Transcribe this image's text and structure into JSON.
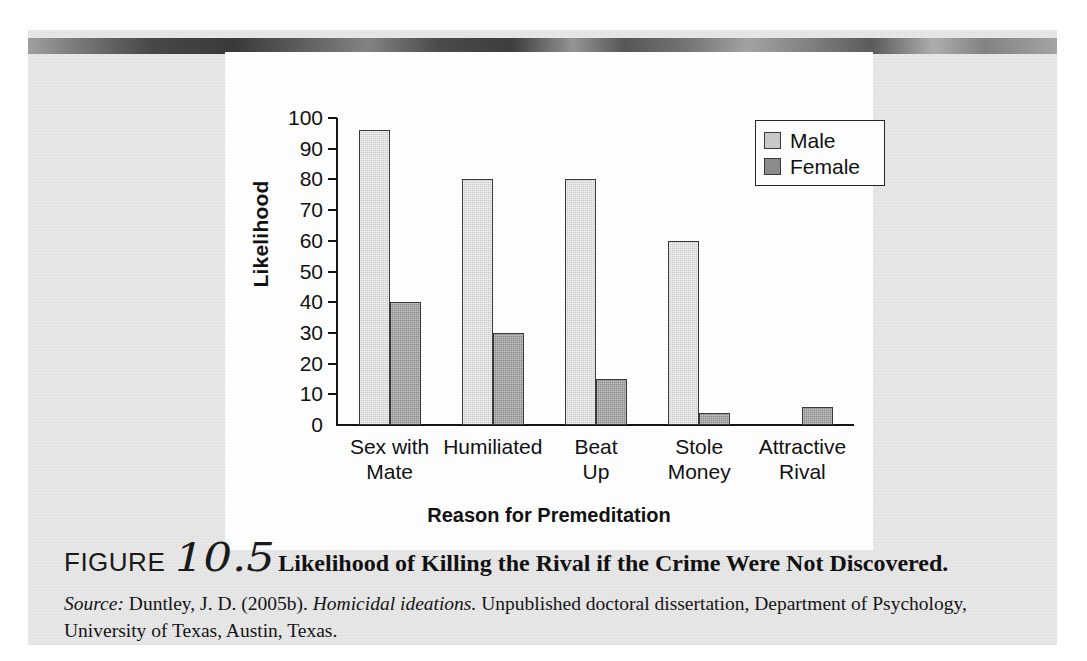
{
  "figure": {
    "label": "FIGURE",
    "number": "10.5",
    "title": "Likelihood of Killing the Rival if the Crime Were Not Discovered.",
    "source_prefix": "Source:",
    "source_author": " Duntley, J. D. (2005b). ",
    "source_italic_title": "Homicidal ideations.",
    "source_rest": " Unpublished doctoral dissertation, Department of Psychology, University of Texas, Austin, Texas."
  },
  "chart_data": {
    "type": "bar",
    "title": "",
    "xlabel": "Reason for Premeditation",
    "ylabel": "Likelihood",
    "ylim": [
      0,
      100
    ],
    "yticks": [
      0,
      10,
      20,
      30,
      40,
      50,
      60,
      70,
      80,
      90,
      100
    ],
    "grid": false,
    "legend_position": "top-right",
    "categories": [
      "Sex with\nMate",
      "Humiliated",
      "Beat\nUp",
      "Stole\nMoney",
      "Attractive\nRival"
    ],
    "category_lines": [
      [
        "Sex with",
        "Mate"
      ],
      [
        "Humiliated",
        ""
      ],
      [
        "Beat",
        "Up"
      ],
      [
        "Stole",
        "Money"
      ],
      [
        "Attractive",
        "Rival"
      ]
    ],
    "series": [
      {
        "name": "Male",
        "color": "#c9c9c9",
        "values": [
          96,
          80,
          80,
          60,
          null
        ]
      },
      {
        "name": "Female",
        "color": "#8c8c8c",
        "values": [
          40,
          30,
          15,
          4,
          6
        ]
      }
    ]
  },
  "colors": {
    "male": "#c9c9c9",
    "female": "#8c8c8c",
    "axis": "#141414",
    "page": "#e9e9e9",
    "card": "#ffffff"
  }
}
